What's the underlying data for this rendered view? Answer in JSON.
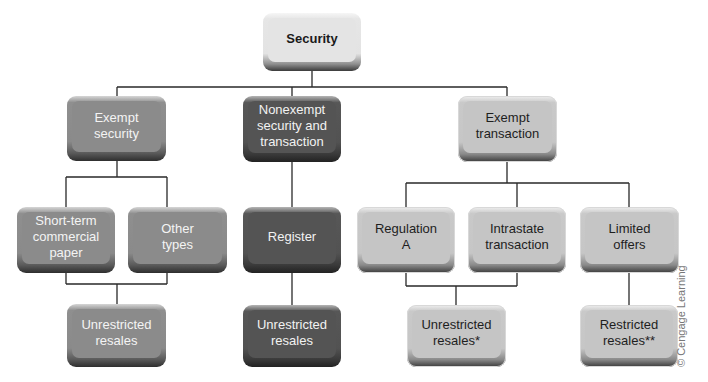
{
  "diagram": {
    "type": "org-chart",
    "root": {
      "label": "Security"
    },
    "level1": [
      {
        "id": "exempt-security",
        "label": "Exempt\nsecurity"
      },
      {
        "id": "nonexempt",
        "label": "Nonexempt\nsecurity and\ntransaction"
      },
      {
        "id": "exempt-transaction",
        "label": "Exempt\ntransaction"
      }
    ],
    "level2": [
      {
        "id": "short-term",
        "label": "Short-term\ncommercial\npaper",
        "parent": "exempt-security"
      },
      {
        "id": "other-types",
        "label": "Other\ntypes",
        "parent": "exempt-security"
      },
      {
        "id": "register",
        "label": "Register",
        "parent": "nonexempt"
      },
      {
        "id": "regulation-a",
        "label": "Regulation\nA",
        "parent": "exempt-transaction"
      },
      {
        "id": "intrastate",
        "label": "Intrastate\ntransaction",
        "parent": "exempt-transaction"
      },
      {
        "id": "limited-offers",
        "label": "Limited\noffers",
        "parent": "exempt-transaction"
      }
    ],
    "level3": [
      {
        "id": "unrestricted-1",
        "label": "Unrestricted\nresales",
        "parents": [
          "short-term",
          "other-types"
        ]
      },
      {
        "id": "unrestricted-2",
        "label": "Unrestricted\nresales",
        "parents": [
          "register"
        ]
      },
      {
        "id": "unrestricted-3",
        "label": "Unrestricted\nresales*",
        "parents": [
          "regulation-a",
          "intrastate"
        ]
      },
      {
        "id": "restricted",
        "label": "Restricted\nresales**",
        "parents": [
          "limited-offers"
        ]
      }
    ]
  },
  "credit": "© Cengage Learning"
}
